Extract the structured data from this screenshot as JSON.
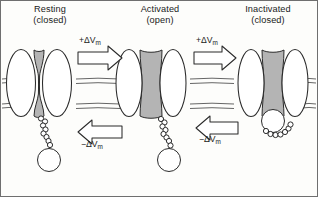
{
  "figure": {
    "kind": "voltage-gated-ion-channel-state-diagram",
    "background_color": "#fdfdfb",
    "border_color": "#6f6f6f",
    "stroke_color": "#2b2b2b",
    "pore_fill_color": "#b4b4b4",
    "subunit_fill_color": "#ffffff"
  },
  "panels": [
    {
      "id": "resting",
      "state_label": "Resting",
      "paren_label": "(closed)",
      "pore": "closed",
      "ball_position": "dangling"
    },
    {
      "id": "activated",
      "state_label": "Activated",
      "paren_label": "(open)",
      "pore": "open",
      "ball_position": "dangling"
    },
    {
      "id": "inactivated",
      "state_label": "Inactivated",
      "paren_label": "(closed)",
      "pore": "open-but-plugged",
      "ball_position": "plugging-pore"
    }
  ],
  "transitions": [
    {
      "id": "resting-to-activated",
      "label_prefix": "+",
      "label_symbol": "ΔV",
      "label_sub": "m",
      "direction": "right",
      "from": "resting",
      "to": "activated"
    },
    {
      "id": "activated-to-inactivated",
      "label_prefix": "+",
      "label_symbol": "ΔV",
      "label_sub": "m",
      "direction": "right",
      "from": "activated",
      "to": "inactivated"
    },
    {
      "id": "activated-to-resting",
      "label_prefix": "−",
      "label_symbol": "ΔV",
      "label_sub": "m",
      "direction": "left",
      "from": "activated",
      "to": "resting"
    },
    {
      "id": "inactivated-to-activated",
      "label_prefix": "−",
      "label_symbol": "ΔV",
      "label_sub": "m",
      "direction": "left",
      "from": "inactivated",
      "to": "activated"
    }
  ],
  "membrane": {
    "description": "lipid bilayer drawn as paired wavy horizontal lines",
    "upper_y": 78,
    "lower_y": 110
  }
}
